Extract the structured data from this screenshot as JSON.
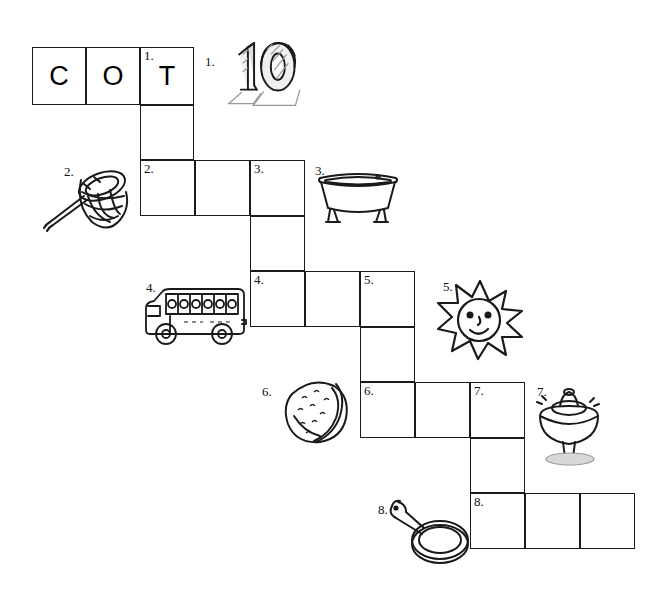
{
  "worksheet": {
    "type": "picture-crossword-puzzle",
    "orientation": "staircase"
  },
  "grid": {
    "cell_size": 54,
    "cells": [
      {
        "id": "r1c1",
        "x": 32,
        "y": 47,
        "w": 54,
        "h": 58,
        "number": "",
        "letter": "C"
      },
      {
        "id": "r1c2",
        "x": 86,
        "y": 47,
        "w": 54,
        "h": 58,
        "number": "",
        "letter": "O"
      },
      {
        "id": "r1c3",
        "x": 140,
        "y": 47,
        "w": 54,
        "h": 58,
        "number": "1.",
        "letter": "T"
      },
      {
        "id": "r2c3",
        "x": 140,
        "y": 105,
        "w": 54,
        "h": 55,
        "number": "",
        "letter": ""
      },
      {
        "id": "r3c3",
        "x": 140,
        "y": 160,
        "w": 55,
        "h": 56,
        "number": "2.",
        "letter": ""
      },
      {
        "id": "r3c4",
        "x": 195,
        "y": 160,
        "w": 55,
        "h": 56,
        "number": "",
        "letter": ""
      },
      {
        "id": "r3c5",
        "x": 250,
        "y": 160,
        "w": 55,
        "h": 56,
        "number": "3.",
        "letter": ""
      },
      {
        "id": "r4c5",
        "x": 250,
        "y": 216,
        "w": 55,
        "h": 55,
        "number": "",
        "letter": ""
      },
      {
        "id": "r5c5",
        "x": 250,
        "y": 271,
        "w": 55,
        "h": 56,
        "number": "4.",
        "letter": ""
      },
      {
        "id": "r5c6",
        "x": 305,
        "y": 271,
        "w": 55,
        "h": 56,
        "number": "",
        "letter": ""
      },
      {
        "id": "r5c7",
        "x": 360,
        "y": 271,
        "w": 55,
        "h": 56,
        "number": "5.",
        "letter": ""
      },
      {
        "id": "r6c7",
        "x": 360,
        "y": 327,
        "w": 55,
        "h": 55,
        "number": "",
        "letter": ""
      },
      {
        "id": "r7c7",
        "x": 360,
        "y": 382,
        "w": 55,
        "h": 56,
        "number": "6.",
        "letter": ""
      },
      {
        "id": "r7c8",
        "x": 415,
        "y": 382,
        "w": 55,
        "h": 56,
        "number": "",
        "letter": ""
      },
      {
        "id": "r7c9",
        "x": 470,
        "y": 382,
        "w": 55,
        "h": 56,
        "number": "7.",
        "letter": ""
      },
      {
        "id": "r8c9",
        "x": 470,
        "y": 438,
        "w": 55,
        "h": 55,
        "number": "",
        "letter": ""
      },
      {
        "id": "r9c9",
        "x": 470,
        "y": 493,
        "w": 55,
        "h": 56,
        "number": "8.",
        "letter": ""
      },
      {
        "id": "r9c10",
        "x": 525,
        "y": 493,
        "w": 55,
        "h": 56,
        "number": "",
        "letter": ""
      },
      {
        "id": "r9c11",
        "x": 580,
        "y": 493,
        "w": 55,
        "h": 56,
        "number": "",
        "letter": ""
      }
    ]
  },
  "clues": [
    {
      "number": "1.",
      "icon": "number-ten-icon",
      "answer_hint": "ten",
      "num_x": 205,
      "num_y": 55,
      "art_x": 218,
      "art_y": 28,
      "art_w": 88,
      "art_h": 88
    },
    {
      "number": "2.",
      "icon": "net-icon",
      "answer_hint": "net",
      "num_x": 64,
      "num_y": 165,
      "art_x": 40,
      "art_y": 158,
      "art_w": 100,
      "art_h": 76
    },
    {
      "number": "3.",
      "icon": "bathtub-icon",
      "answer_hint": "tub",
      "num_x": 315,
      "num_y": 164,
      "art_x": 312,
      "art_y": 160,
      "art_w": 92,
      "art_h": 68
    },
    {
      "number": "4.",
      "icon": "school-bus-icon",
      "answer_hint": "bus",
      "num_x": 146,
      "num_y": 281,
      "art_x": 140,
      "art_y": 280,
      "art_w": 110,
      "art_h": 70
    },
    {
      "number": "5.",
      "icon": "sun-icon",
      "answer_hint": "sun",
      "num_x": 443,
      "num_y": 280,
      "art_x": 432,
      "art_y": 275,
      "art_w": 96,
      "art_h": 86
    },
    {
      "number": "6.",
      "icon": "nut-icon",
      "answer_hint": "nut",
      "num_x": 262,
      "num_y": 385,
      "art_x": 276,
      "art_y": 374,
      "art_w": 80,
      "art_h": 72
    },
    {
      "number": "7.",
      "icon": "spinning-top-icon",
      "answer_hint": "top",
      "num_x": 537,
      "num_y": 385,
      "art_x": 530,
      "art_y": 382,
      "art_w": 78,
      "art_h": 84
    },
    {
      "number": "8.",
      "icon": "frying-pan-icon",
      "answer_hint": "pan",
      "num_x": 378,
      "num_y": 503,
      "art_x": 384,
      "art_y": 496,
      "art_w": 88,
      "art_h": 72
    }
  ]
}
